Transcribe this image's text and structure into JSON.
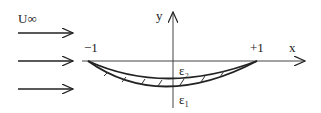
{
  "diagram": {
    "freestream_label": "U∞",
    "axis_x_label": "x",
    "axis_y_label": "y",
    "leading_edge_label": "−1",
    "trailing_edge_label": "+1",
    "upper_surface_label": "ε₂",
    "lower_surface_label": "ε₁",
    "arrow_count": 3,
    "colors": {
      "ink": "#222222",
      "background": "#ffffff"
    }
  }
}
